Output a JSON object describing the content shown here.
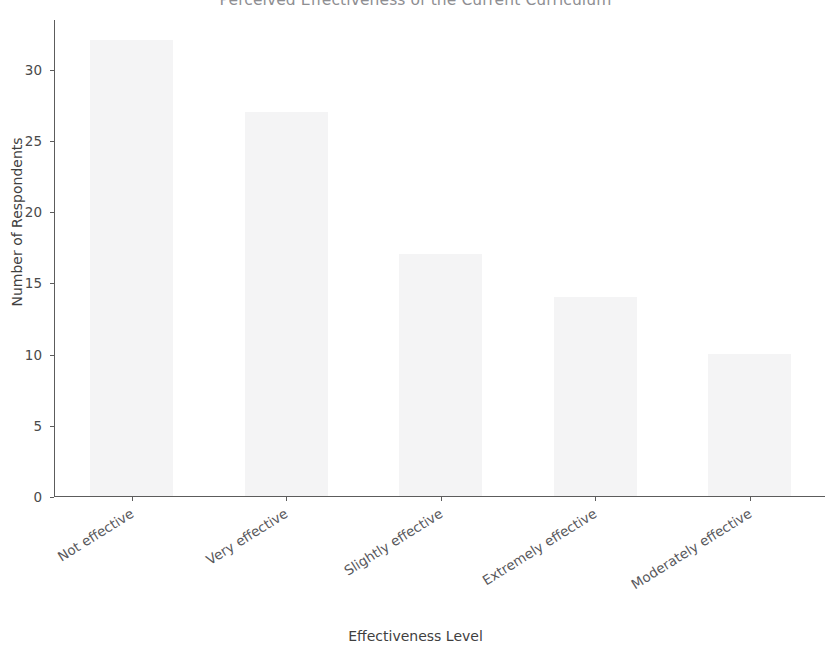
{
  "chart_data": {
    "type": "bar",
    "title": "Perceived Effectiveness of the Current Curriculum",
    "xlabel": "Effectiveness Level",
    "ylabel": "Number of Respondents",
    "categories": [
      "Not effective",
      "Very effective",
      "Slightly effective",
      "Extremely effective",
      "Moderately effective"
    ],
    "values": [
      32,
      27,
      17,
      14,
      10
    ],
    "ylim": [
      0,
      33.5
    ],
    "yticks": [
      0,
      5,
      10,
      15,
      20,
      25,
      30
    ],
    "ytick_labels": [
      "0",
      "5",
      "10",
      "15",
      "20",
      "25",
      "30"
    ],
    "grid": false,
    "legend": null,
    "bar_color": "#f4f4f5",
    "axis_color": "#5c5c5c",
    "title_color": "#8e8e92",
    "text_color": "#3f3f3f"
  }
}
